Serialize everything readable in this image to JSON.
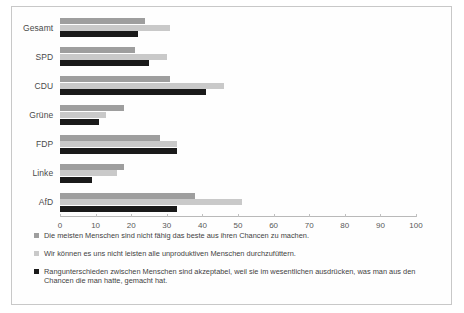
{
  "chart_data": {
    "type": "bar",
    "orientation": "horizontal",
    "title": "",
    "xlabel": "",
    "ylabel": "",
    "xlim": [
      0,
      100
    ],
    "xticks": [
      0,
      10,
      20,
      30,
      40,
      50,
      60,
      70,
      80,
      90,
      100
    ],
    "grid": false,
    "legend_position": "bottom",
    "categories": [
      "Gesamt",
      "SPD",
      "CDU",
      "Grüne",
      "FDP",
      "Linke",
      "AfD"
    ],
    "series": [
      {
        "name": "Die meisten Menschen sind nicht fähig das beste aus ihren Chancen zu machen.",
        "color": "#9e9e9e",
        "values": [
          24,
          21,
          31,
          18,
          28,
          18,
          38
        ]
      },
      {
        "name": "Wir können es uns nicht leisten alle unproduktiven Menschen durchzufüttern.",
        "color": "#c9c9c9",
        "values": [
          31,
          30,
          46,
          13,
          33,
          16,
          51
        ]
      },
      {
        "name": "Rangunterschieden zwischen Menschen sind akzeptabel, weil sie im wesentlichen ausdrücken, was man aus den Chancen die man hatte, gemacht hat.",
        "color": "#1a1a1a",
        "values": [
          22,
          25,
          41,
          11,
          33,
          9,
          33
        ]
      }
    ]
  }
}
